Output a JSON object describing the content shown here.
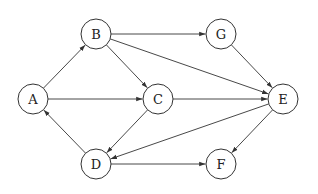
{
  "diagram": {
    "type": "directed-graph",
    "node_radius": 15,
    "colors": {
      "stroke": "#333333",
      "fill": "#ffffff",
      "text": "#222222"
    },
    "nodes": [
      {
        "id": "A",
        "label": "A",
        "x": 33,
        "y": 99
      },
      {
        "id": "B",
        "label": "B",
        "x": 96,
        "y": 34
      },
      {
        "id": "C",
        "label": "C",
        "x": 158,
        "y": 99
      },
      {
        "id": "D",
        "label": "D",
        "x": 96,
        "y": 164
      },
      {
        "id": "G",
        "label": "G",
        "x": 221,
        "y": 34
      },
      {
        "id": "E",
        "label": "E",
        "x": 283,
        "y": 99
      },
      {
        "id": "F",
        "label": "F",
        "x": 221,
        "y": 164
      }
    ],
    "edges": [
      {
        "from": "A",
        "to": "B"
      },
      {
        "from": "A",
        "to": "C"
      },
      {
        "from": "B",
        "to": "C"
      },
      {
        "from": "B",
        "to": "G"
      },
      {
        "from": "B",
        "to": "E"
      },
      {
        "from": "C",
        "to": "E"
      },
      {
        "from": "C",
        "to": "D"
      },
      {
        "from": "D",
        "to": "A"
      },
      {
        "from": "D",
        "to": "F"
      },
      {
        "from": "G",
        "to": "E"
      },
      {
        "from": "E",
        "to": "D"
      },
      {
        "from": "E",
        "to": "F"
      }
    ]
  }
}
